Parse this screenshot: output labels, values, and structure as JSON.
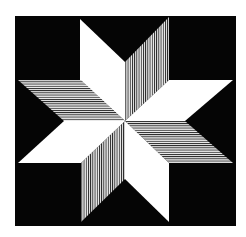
{
  "artwork": {
    "title": "Eight-pointed star",
    "description": "Op-art eight-pointed star: alternating plain white and line-hatched rhombi on a black square",
    "colors": {
      "page_background": "#ffffff",
      "field": "#050505",
      "plain_rhombus": "#ffffff",
      "stripe_line": "#1a1a1a",
      "stripe_gap": "#f2f2f2"
    },
    "field": {
      "x": 15,
      "y": 16,
      "width": 221,
      "height": 210
    },
    "center": {
      "x": 125,
      "y": 121
    },
    "rhombi": [
      {
        "name": "upper-left-white",
        "fill": "plain",
        "points": "80,19 125,62 125,121 80,80"
      },
      {
        "name": "upper-right-striped",
        "fill": "vertical-stripes",
        "points": "125,62 169,17 169,80 125,121"
      },
      {
        "name": "right-upper-white",
        "fill": "plain",
        "points": "169,80 233,80 185,121 125,121"
      },
      {
        "name": "right-lower-striped",
        "fill": "horizontal-stripes",
        "points": "125,121 185,121 233,163 169,163"
      },
      {
        "name": "lower-right-white",
        "fill": "plain",
        "points": "125,121 169,163 169,222 125,179"
      },
      {
        "name": "lower-left-striped",
        "fill": "vertical-stripes",
        "points": "125,121 125,179 81,222 81,163"
      },
      {
        "name": "left-lower-white",
        "fill": "plain",
        "points": "125,121 81,163 18,163 64,121"
      },
      {
        "name": "left-upper-striped",
        "fill": "horizontal-stripes",
        "points": "125,121 64,121 18,80 81,80"
      }
    ]
  }
}
